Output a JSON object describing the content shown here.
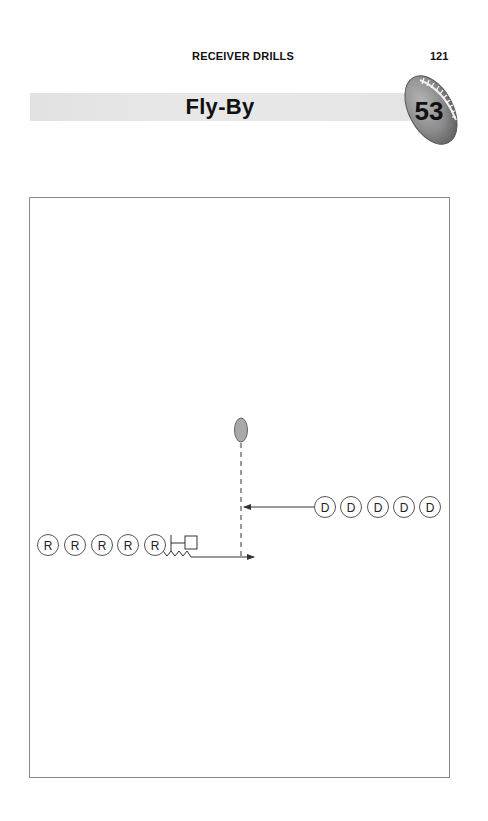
{
  "header": {
    "section_title": "RECEIVER DRILLS",
    "page_number": "121"
  },
  "drill": {
    "title": "Fly-By",
    "number": "53",
    "badge_icon": "football-icon"
  },
  "diagram": {
    "ball_icon": "football-icon",
    "receivers": {
      "label": "R",
      "count": 5,
      "centers_x": [
        48,
        75,
        102,
        128,
        155
      ],
      "center_y": 545
    },
    "defenders": {
      "label": "D",
      "count": 5,
      "centers_x": [
        325,
        351,
        378,
        404,
        430
      ],
      "center_y": 507
    },
    "player_radius": 10.5,
    "colors": {
      "stroke": "#555555",
      "ball_fill": "#a8a8a8",
      "border": "#8a8a8a"
    }
  }
}
